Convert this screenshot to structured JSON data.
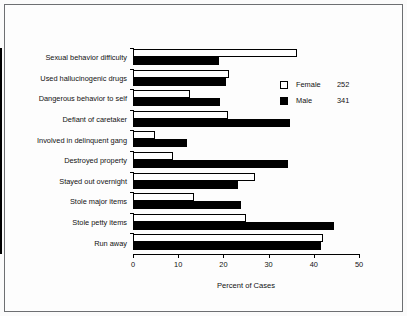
{
  "chart_data": {
    "type": "bar",
    "orientation": "horizontal",
    "title": "",
    "xlabel": "Percent of Cases",
    "ylabel": "",
    "xlim": [
      0,
      50
    ],
    "xticks": [
      0,
      10,
      20,
      30,
      40,
      50
    ],
    "grid": false,
    "legend_position": "upper-right",
    "categories": [
      "Sexual behavior difficulty",
      "Used hallucinogenic drugs",
      "Dangerous behavior to self",
      "Defiant of caretaker",
      "Involved in delinquent gang",
      "Destroyed property",
      "Stayed out overnight",
      "Stole major items",
      "Stole petty items",
      "Run away"
    ],
    "series": [
      {
        "name": "Female",
        "count": "252",
        "color": "#ffffff",
        "values": [
          36.2,
          21.3,
          12.6,
          21.0,
          4.9,
          8.8,
          27.0,
          13.6,
          25.0,
          42.0
        ]
      },
      {
        "name": "Male",
        "count": "341",
        "color": "#000000",
        "values": [
          19.0,
          20.6,
          19.2,
          34.8,
          12.0,
          34.2,
          23.2,
          24.0,
          44.5,
          41.6
        ]
      }
    ]
  },
  "legend": {
    "entries": [
      {
        "label": "Female",
        "value": "252",
        "swatch": "open-square-icon"
      },
      {
        "label": "Male",
        "value": "341",
        "swatch": "filled-square-icon"
      }
    ]
  },
  "axis": {
    "x_title": "Percent of Cases",
    "x_tick_labels": [
      "0",
      "10",
      "20",
      "30",
      "40",
      "50"
    ]
  }
}
